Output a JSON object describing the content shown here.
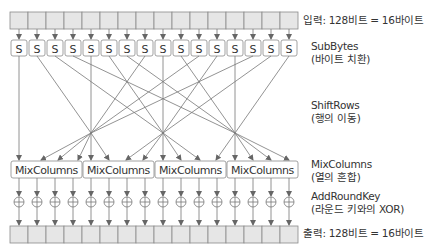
{
  "labels": {
    "input": "입력: 128비트 = 16바이트",
    "subbytes_title": "SubBytes",
    "subbytes_sub": "(바이트 치환)",
    "shiftrows_title": "ShiftRows",
    "shiftrows_sub": "(행의 이동)",
    "mixcolumns_title": "MixColumns",
    "mixcolumns_sub": "(열의 혼합)",
    "addroundkey_title": "AddRoundKey",
    "addroundkey_sub": "(라운드 키와의 XOR)",
    "output": "출력: 128비트 = 16바이트"
  },
  "sbox_label": "S",
  "mixcolumns_label": "MixColumns",
  "byte_count": 16,
  "mixcolumns_count": 4,
  "colors": {
    "box_fill": "#e6e6e6",
    "box_stroke": "#8a8a8a",
    "line": "#777777",
    "text": "#333333"
  }
}
